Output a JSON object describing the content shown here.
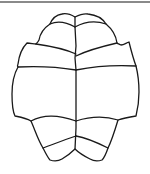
{
  "figure": {
    "stroke_color": "#1a1a1a",
    "border_color": "#8a8a8a",
    "background": "#ffffff"
  }
}
